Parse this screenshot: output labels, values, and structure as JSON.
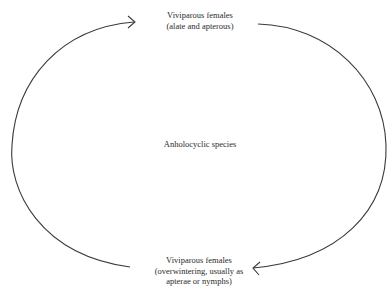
{
  "diagram": {
    "type": "life-cycle",
    "center_label": "Anholocyclic species",
    "nodes": [
      {
        "id": "top",
        "lines": [
          "Viviparous females",
          "(alate and apterous)"
        ]
      },
      {
        "id": "bottom",
        "lines": [
          "Viviparous females",
          "(overwintering, usually as",
          "apterae or nymphs)"
        ]
      }
    ],
    "edges": [
      {
        "from": "bottom",
        "to": "top",
        "side": "left",
        "style": "curved-arrow"
      },
      {
        "from": "top",
        "to": "bottom",
        "side": "right",
        "style": "curved-arrow"
      }
    ],
    "colors": {
      "stroke": "#3a3a3a",
      "text": "#2b2b2b",
      "background": "#ffffff"
    }
  }
}
